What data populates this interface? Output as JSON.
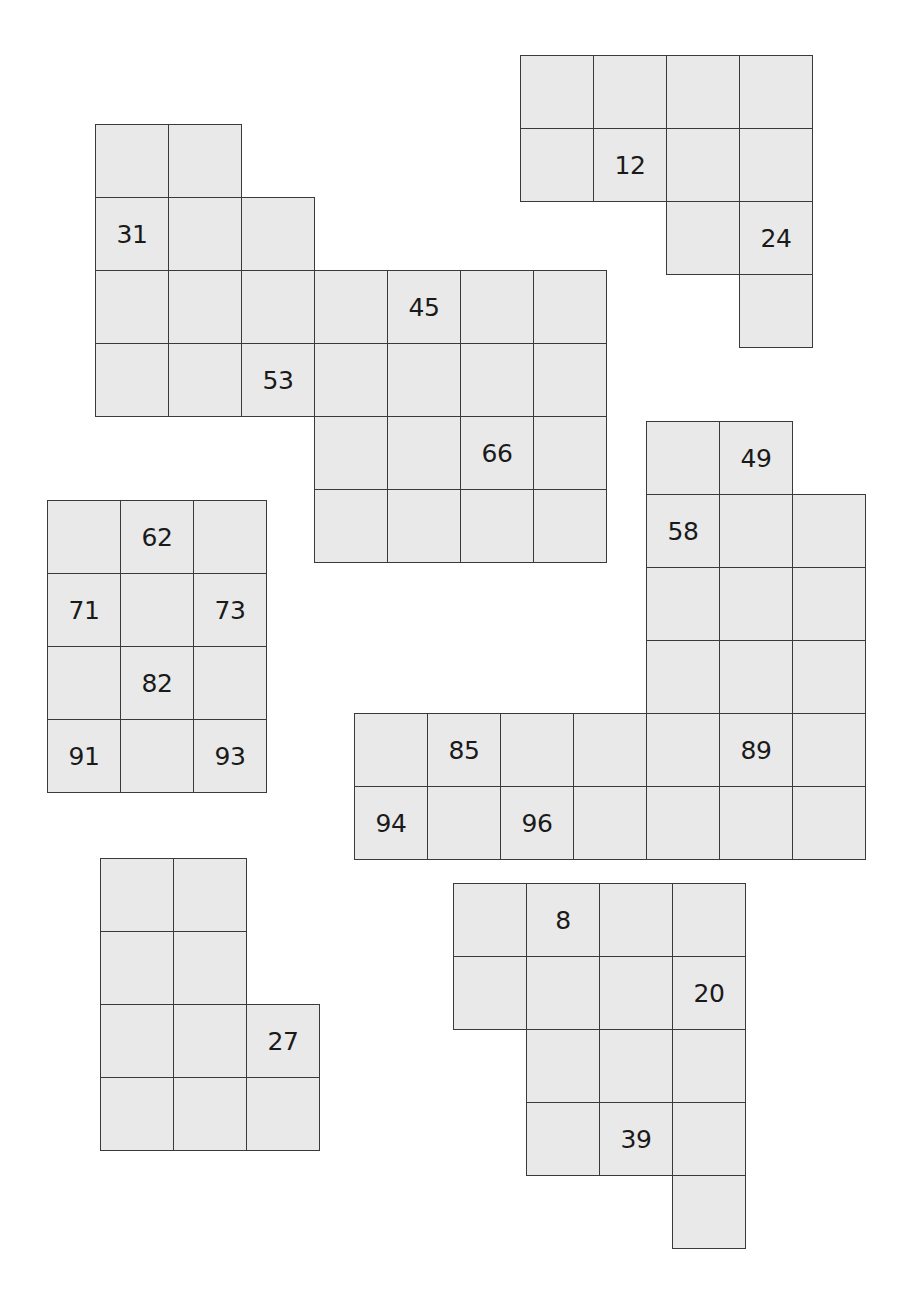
{
  "puzzle": {
    "cell_size": 73,
    "colors": {
      "fill": "#e9e9e9",
      "border": "#3a3a3a",
      "text": "#1a1a1a",
      "background": "#ffffff"
    },
    "shapes": [
      {
        "id": "shape-31-53-45-66",
        "origin": [
          95,
          124
        ],
        "cells": [
          {
            "r": 0,
            "c": 0,
            "label": ""
          },
          {
            "r": 0,
            "c": 1,
            "label": ""
          },
          {
            "r": 1,
            "c": 0,
            "label": "31"
          },
          {
            "r": 1,
            "c": 1,
            "label": ""
          },
          {
            "r": 1,
            "c": 2,
            "label": ""
          },
          {
            "r": 2,
            "c": 0,
            "label": ""
          },
          {
            "r": 2,
            "c": 1,
            "label": ""
          },
          {
            "r": 2,
            "c": 2,
            "label": ""
          },
          {
            "r": 3,
            "c": 0,
            "label": ""
          },
          {
            "r": 3,
            "c": 1,
            "label": ""
          },
          {
            "r": 3,
            "c": 2,
            "label": "53"
          },
          {
            "r": 2,
            "c": 3,
            "label": ""
          },
          {
            "r": 2,
            "c": 4,
            "label": "45"
          },
          {
            "r": 2,
            "c": 5,
            "label": ""
          },
          {
            "r": 2,
            "c": 6,
            "label": ""
          },
          {
            "r": 3,
            "c": 3,
            "label": ""
          },
          {
            "r": 3,
            "c": 4,
            "label": ""
          },
          {
            "r": 3,
            "c": 5,
            "label": ""
          },
          {
            "r": 3,
            "c": 6,
            "label": ""
          },
          {
            "r": 4,
            "c": 3,
            "label": ""
          },
          {
            "r": 4,
            "c": 4,
            "label": ""
          },
          {
            "r": 4,
            "c": 5,
            "label": "66"
          },
          {
            "r": 4,
            "c": 6,
            "label": ""
          },
          {
            "r": 5,
            "c": 3,
            "label": ""
          },
          {
            "r": 5,
            "c": 4,
            "label": ""
          },
          {
            "r": 5,
            "c": 5,
            "label": ""
          },
          {
            "r": 5,
            "c": 6,
            "label": ""
          }
        ]
      },
      {
        "id": "shape-12-24",
        "origin": [
          520,
          55
        ],
        "cells": [
          {
            "r": 0,
            "c": 0,
            "label": ""
          },
          {
            "r": 0,
            "c": 1,
            "label": ""
          },
          {
            "r": 0,
            "c": 2,
            "label": ""
          },
          {
            "r": 0,
            "c": 3,
            "label": ""
          },
          {
            "r": 1,
            "c": 0,
            "label": ""
          },
          {
            "r": 1,
            "c": 1,
            "label": "12"
          },
          {
            "r": 1,
            "c": 2,
            "label": ""
          },
          {
            "r": 1,
            "c": 3,
            "label": ""
          },
          {
            "r": 2,
            "c": 2,
            "label": ""
          },
          {
            "r": 2,
            "c": 3,
            "label": "24"
          },
          {
            "r": 3,
            "c": 3,
            "label": ""
          }
        ]
      },
      {
        "id": "shape-62-93",
        "origin": [
          47,
          500
        ],
        "cells": [
          {
            "r": 0,
            "c": 0,
            "label": ""
          },
          {
            "r": 0,
            "c": 1,
            "label": "62"
          },
          {
            "r": 0,
            "c": 2,
            "label": ""
          },
          {
            "r": 1,
            "c": 0,
            "label": "71"
          },
          {
            "r": 1,
            "c": 1,
            "label": ""
          },
          {
            "r": 1,
            "c": 2,
            "label": "73"
          },
          {
            "r": 2,
            "c": 0,
            "label": ""
          },
          {
            "r": 2,
            "c": 1,
            "label": "82"
          },
          {
            "r": 2,
            "c": 2,
            "label": ""
          },
          {
            "r": 3,
            "c": 0,
            "label": "91"
          },
          {
            "r": 3,
            "c": 1,
            "label": ""
          },
          {
            "r": 3,
            "c": 2,
            "label": "93"
          }
        ]
      },
      {
        "id": "shape-49-96",
        "origin": [
          354,
          421
        ],
        "cells": [
          {
            "r": 0,
            "c": 4,
            "label": ""
          },
          {
            "r": 0,
            "c": 5,
            "label": "49"
          },
          {
            "r": 1,
            "c": 4,
            "label": "58"
          },
          {
            "r": 1,
            "c": 5,
            "label": ""
          },
          {
            "r": 1,
            "c": 6,
            "label": ""
          },
          {
            "r": 2,
            "c": 4,
            "label": ""
          },
          {
            "r": 2,
            "c": 5,
            "label": ""
          },
          {
            "r": 2,
            "c": 6,
            "label": ""
          },
          {
            "r": 3,
            "c": 4,
            "label": ""
          },
          {
            "r": 3,
            "c": 5,
            "label": ""
          },
          {
            "r": 3,
            "c": 6,
            "label": ""
          },
          {
            "r": 4,
            "c": 0,
            "label": ""
          },
          {
            "r": 4,
            "c": 1,
            "label": "85"
          },
          {
            "r": 4,
            "c": 2,
            "label": ""
          },
          {
            "r": 4,
            "c": 3,
            "label": ""
          },
          {
            "r": 4,
            "c": 4,
            "label": ""
          },
          {
            "r": 4,
            "c": 5,
            "label": "89"
          },
          {
            "r": 4,
            "c": 6,
            "label": ""
          },
          {
            "r": 5,
            "c": 0,
            "label": "94"
          },
          {
            "r": 5,
            "c": 1,
            "label": ""
          },
          {
            "r": 5,
            "c": 2,
            "label": "96"
          },
          {
            "r": 5,
            "c": 3,
            "label": ""
          },
          {
            "r": 5,
            "c": 4,
            "label": ""
          },
          {
            "r": 5,
            "c": 5,
            "label": ""
          },
          {
            "r": 5,
            "c": 6,
            "label": ""
          }
        ]
      },
      {
        "id": "shape-27",
        "origin": [
          100,
          858
        ],
        "cells": [
          {
            "r": 0,
            "c": 0,
            "label": ""
          },
          {
            "r": 0,
            "c": 1,
            "label": ""
          },
          {
            "r": 1,
            "c": 0,
            "label": ""
          },
          {
            "r": 1,
            "c": 1,
            "label": ""
          },
          {
            "r": 2,
            "c": 0,
            "label": ""
          },
          {
            "r": 2,
            "c": 1,
            "label": ""
          },
          {
            "r": 2,
            "c": 2,
            "label": "27"
          },
          {
            "r": 3,
            "c": 0,
            "label": ""
          },
          {
            "r": 3,
            "c": 1,
            "label": ""
          },
          {
            "r": 3,
            "c": 2,
            "label": ""
          }
        ]
      },
      {
        "id": "shape-8-20-39",
        "origin": [
          453,
          883
        ],
        "cells": [
          {
            "r": 0,
            "c": 0,
            "label": ""
          },
          {
            "r": 0,
            "c": 1,
            "label": "8"
          },
          {
            "r": 0,
            "c": 2,
            "label": ""
          },
          {
            "r": 0,
            "c": 3,
            "label": ""
          },
          {
            "r": 1,
            "c": 0,
            "label": ""
          },
          {
            "r": 1,
            "c": 1,
            "label": ""
          },
          {
            "r": 1,
            "c": 2,
            "label": ""
          },
          {
            "r": 1,
            "c": 3,
            "label": "20"
          },
          {
            "r": 2,
            "c": 1,
            "label": ""
          },
          {
            "r": 2,
            "c": 2,
            "label": ""
          },
          {
            "r": 2,
            "c": 3,
            "label": ""
          },
          {
            "r": 3,
            "c": 1,
            "label": ""
          },
          {
            "r": 3,
            "c": 2,
            "label": "39"
          },
          {
            "r": 3,
            "c": 3,
            "label": ""
          },
          {
            "r": 4,
            "c": 3,
            "label": ""
          }
        ]
      }
    ]
  }
}
